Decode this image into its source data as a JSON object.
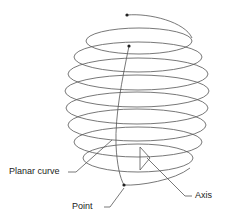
{
  "diagram": {
    "labels": {
      "planar_curve": "Planar curve",
      "point": "Point",
      "axis": "Axis"
    },
    "colors": {
      "stroke": "#555555",
      "point": "#222222",
      "text": "#222222"
    }
  }
}
